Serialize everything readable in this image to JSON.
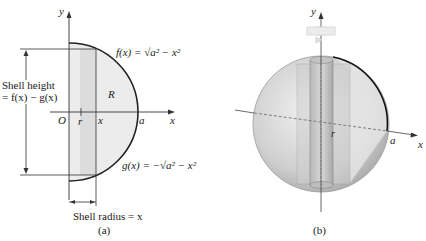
{
  "figure_a": {
    "axis_x": "x",
    "axis_y": "y",
    "origin": "O",
    "r_label": "r",
    "x_tick": "x",
    "a_label": "a",
    "region_label": "R",
    "f_label": "f(x) = √a² − x²",
    "g_label": "g(x) = −√a² − x²",
    "shell_height_line1": "Shell height",
    "shell_height_line2": "= f(x) − g(x)",
    "shell_radius": "Shell radius = x",
    "caption": "(a)"
  },
  "figure_b": {
    "axis_x": "x",
    "axis_y": "y",
    "r_label": "r",
    "a_label": "a",
    "caption": "(b)"
  }
}
